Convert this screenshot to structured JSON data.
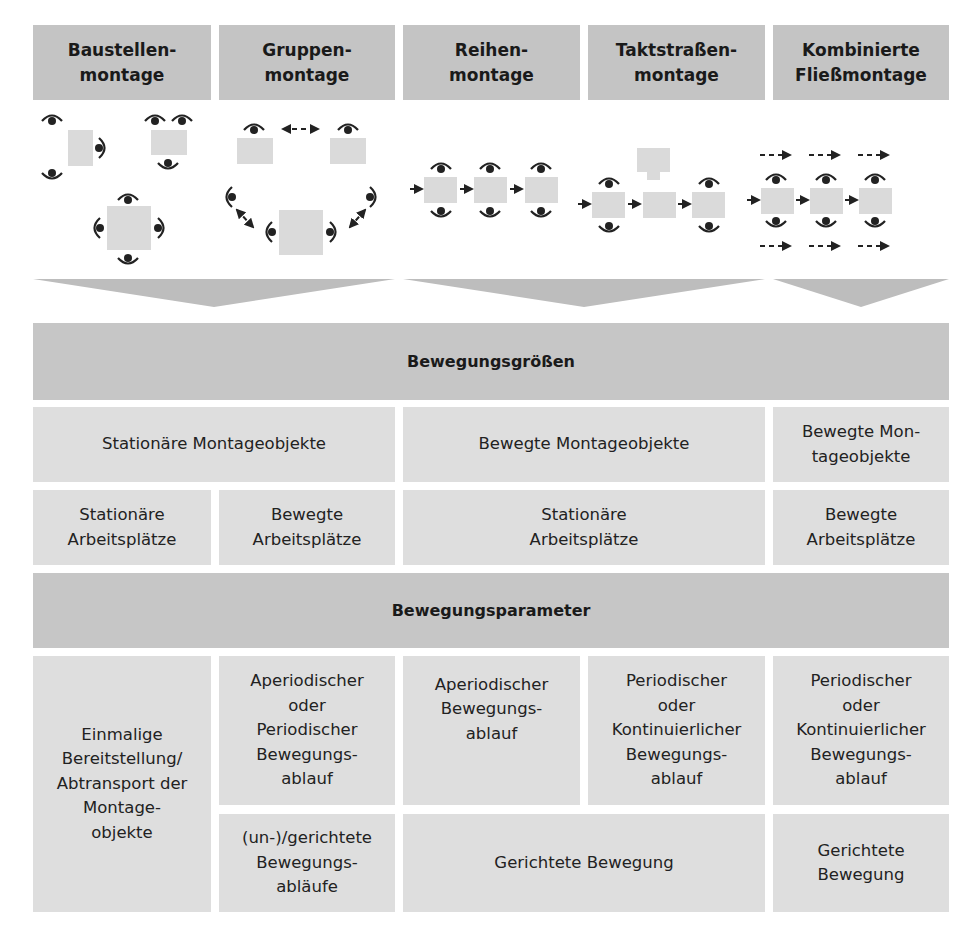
{
  "headers": [
    {
      "label": "Baustellen-\nmontage"
    },
    {
      "label": "Gruppen-\nmontage"
    },
    {
      "label": "Reihen-\nmontage"
    },
    {
      "label": "Taktstraßen-\nmontage"
    },
    {
      "label": "Kombinierte\nFließmontage"
    }
  ],
  "diagrams": [
    {
      "name": "baustellenmontage-diagram",
      "icons": [
        "eye-icon",
        "workpiece-square"
      ]
    },
    {
      "name": "gruppenmontage-diagram",
      "icons": [
        "eye-icon",
        "workpiece-square",
        "double-arrow-icon"
      ]
    },
    {
      "name": "reihenmontage-diagram",
      "icons": [
        "eye-icon",
        "workpiece-square",
        "arrow-right-icon"
      ]
    },
    {
      "name": "taktstrassenmontage-diagram",
      "icons": [
        "eye-icon",
        "workpiece-square",
        "arrow-right-icon"
      ]
    },
    {
      "name": "kombinierte-fliessmontage-diagram",
      "icons": [
        "eye-icon",
        "workpiece-square",
        "arrow-right-icon",
        "dashed-arrow-icon"
      ]
    }
  ],
  "bands": {
    "bewegungsgroessen": "Bewegungsgrößen",
    "bewegungsparameter": "Bewegungsparameter"
  },
  "montageobjekte": [
    {
      "label": "Stationäre Montageobjekte"
    },
    {
      "label": "Bewegte Montageobjekte"
    },
    {
      "label": "Bewegte Mon-\ntageobjekte"
    }
  ],
  "arbeitsplaetze": [
    {
      "label": "Stationäre\nArbeitsplätze"
    },
    {
      "label": "Bewegte\nArbeitsplätze"
    },
    {
      "label": "Stationäre\nArbeitsplätze"
    },
    {
      "label": "Bewegte\nArbeitsplätze"
    }
  ],
  "parameter": {
    "einmalig": "Einmalige\nBereitstellung/\nAbtransport der\nMontage-\nobjekte",
    "ablauf": [
      {
        "label": "Aperiodischer\noder\nPeriodischer\nBewegungs-\nablauf"
      },
      {
        "label": "Aperiodischer\nBewegungs-\nablauf"
      },
      {
        "label": "Periodischer\noder\nKontinuierlicher\nBewegungs-\nablauf"
      },
      {
        "label": "Periodischer\noder\nKontinuierlicher\nBewegungs-\nablauf"
      }
    ],
    "richtung": [
      {
        "label": "(un-)/gerichtete\nBewegungs-\nabläufe"
      },
      {
        "label": "Gerichtete Bewegung"
      },
      {
        "label": "Gerichtete\nBewegung"
      }
    ]
  },
  "colors": {
    "header_bg": "#c4c4c4",
    "band_bg": "#c6c6c6",
    "cell_bg": "#dedede",
    "chevron": "#bdbdbd",
    "workpiece": "#d8d8d8",
    "icon": "#222222"
  }
}
